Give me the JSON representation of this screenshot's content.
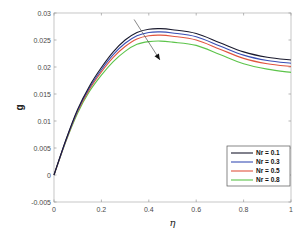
{
  "chart_data": {
    "type": "line",
    "title": "",
    "xlabel": "η",
    "ylabel": "g",
    "xlim": [
      0,
      1
    ],
    "ylim": [
      -0.005,
      0.03
    ],
    "xticks": [
      0,
      0.2,
      0.4,
      0.6,
      0.8,
      1
    ],
    "xtick_labels": [
      "0",
      "0.2",
      "0.4",
      "0.6",
      "0.8",
      "1"
    ],
    "yticks": [
      -0.005,
      0,
      0.005,
      0.01,
      0.015,
      0.02,
      0.025,
      0.03
    ],
    "ytick_labels": [
      "-0.005",
      "0",
      "0.005",
      "0.01",
      "0.015",
      "0.02",
      "0.025",
      "0.03"
    ],
    "grid": false,
    "legend_position": "bottom-right",
    "x": [
      0,
      0.05,
      0.1,
      0.15,
      0.2,
      0.25,
      0.3,
      0.35,
      0.4,
      0.45,
      0.5,
      0.6,
      0.7,
      0.8,
      0.9,
      1.0
    ],
    "series": [
      {
        "name": "Nr = 0.1",
        "color": "#1a1a2e",
        "values": [
          0,
          0.0065,
          0.0122,
          0.0165,
          0.0199,
          0.0228,
          0.025,
          0.0264,
          0.027,
          0.0271,
          0.0269,
          0.0262,
          0.0245,
          0.0228,
          0.0218,
          0.0213
        ]
      },
      {
        "name": "Nr = 0.3",
        "color": "#3a4fb5",
        "values": [
          0,
          0.0064,
          0.012,
          0.0162,
          0.0195,
          0.0223,
          0.0244,
          0.0258,
          0.0264,
          0.0265,
          0.0263,
          0.0256,
          0.0239,
          0.0222,
          0.0212,
          0.0207
        ]
      },
      {
        "name": "Nr = 0.5",
        "color": "#e0553f",
        "values": [
          0,
          0.0063,
          0.0118,
          0.0159,
          0.0191,
          0.0218,
          0.0238,
          0.0252,
          0.0258,
          0.0259,
          0.0257,
          0.025,
          0.0233,
          0.0216,
          0.0206,
          0.0201
        ]
      },
      {
        "name": "Nr = 0.8",
        "color": "#5cc44a",
        "values": [
          0,
          0.0062,
          0.0115,
          0.0155,
          0.0185,
          0.021,
          0.0229,
          0.0242,
          0.0247,
          0.0248,
          0.0246,
          0.024,
          0.0223,
          0.0206,
          0.0196,
          0.019
        ]
      }
    ],
    "annotations": [
      {
        "type": "arrow",
        "meaning": "increasing Nr",
        "from": [
          0.338,
          0.0288
        ],
        "to": [
          0.447,
          0.0213
        ],
        "color": "#555555"
      }
    ]
  }
}
